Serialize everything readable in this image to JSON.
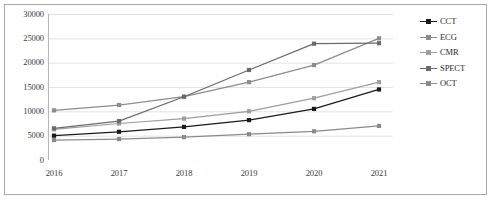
{
  "chart_data": {
    "type": "line",
    "title": "",
    "xlabel": "",
    "ylabel": "",
    "categories": [
      "2016",
      "2017",
      "2018",
      "2019",
      "2020",
      "2021"
    ],
    "ylim": [
      0,
      30000
    ],
    "ytick_values": [
      0,
      5000,
      10000,
      15000,
      20000,
      25000,
      30000
    ],
    "ytick_labels": [
      "0",
      "5000",
      "10000",
      "15000",
      "20000",
      "25000",
      "30000"
    ],
    "grid": true,
    "legend_position": "right",
    "series": [
      {
        "name": "CCT",
        "color": "#1a1a1a",
        "marker": "square",
        "values": [
          5000,
          5800,
          6800,
          8200,
          10500,
          14500
        ]
      },
      {
        "name": "ECG",
        "color": "#8c8c8c",
        "marker": "square",
        "values": [
          10200,
          11300,
          13000,
          16000,
          19500,
          25000
        ]
      },
      {
        "name": "CMR",
        "color": "#9e9e9e",
        "marker": "square",
        "values": [
          6300,
          7500,
          8500,
          10000,
          12700,
          16000
        ]
      },
      {
        "name": "SPECT",
        "color": "#6b6b6b",
        "marker": "square",
        "values": [
          6500,
          8000,
          13000,
          18500,
          23900,
          24000
        ]
      },
      {
        "name": "OCT",
        "color": "#8a8a8a",
        "marker": "square",
        "values": [
          4100,
          4300,
          4700,
          5300,
          5900,
          7000
        ]
      }
    ]
  },
  "axes": {
    "gridline_color": "#e3e3e3",
    "axis_color": "#b8b8b8",
    "tick_text_color": "#3a3a3a"
  },
  "frame": {
    "border_color": "#a9a9a9",
    "background": "#ffffff"
  }
}
